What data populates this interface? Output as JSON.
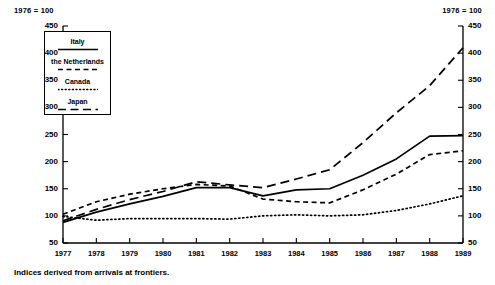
{
  "header": {
    "left_note": "1976 = 100",
    "right_note": "1976 = 100"
  },
  "footnote": "Indices derived from arrivals at frontiers.",
  "legend": {
    "entries": [
      {
        "label": "Italy",
        "style": "solid",
        "color": "#000000"
      },
      {
        "label": "the Netherlands",
        "style": "dashed-short",
        "color": "#000000"
      },
      {
        "label": "Canada",
        "style": "dotted",
        "color": "#000000"
      },
      {
        "label": "Japan",
        "style": "dashed-long",
        "color": "#000000"
      }
    ]
  },
  "chart_data": {
    "type": "line",
    "title": "",
    "subtitle": "",
    "xlabel": "",
    "ylabel": "",
    "note": "1976 = 100",
    "grid": false,
    "legend_position": "upper-left-inside-box",
    "x": [
      1977,
      1978,
      1979,
      1980,
      1981,
      1982,
      1983,
      1984,
      1985,
      1986,
      1987,
      1988,
      1989
    ],
    "xtick_labels": [
      "1977",
      "1978",
      "1979",
      "1980",
      "1981",
      "1982",
      "1983",
      "1984",
      "1985",
      "1986",
      "1987",
      "1988",
      "1989"
    ],
    "xlim": [
      1977,
      1989
    ],
    "ylim": [
      50,
      450
    ],
    "ytick_labels": [
      "50",
      "100",
      "150",
      "200",
      "250",
      "300",
      "350",
      "400",
      "450"
    ],
    "yticks": [
      50,
      100,
      150,
      200,
      250,
      300,
      350,
      400,
      450
    ],
    "y_axis_both_sides": true,
    "series": [
      {
        "name": "Italy",
        "style": "solid",
        "color": "#000000",
        "values": [
          88,
          107,
          122,
          136,
          152,
          152,
          137,
          148,
          150,
          175,
          205,
          247,
          248
        ]
      },
      {
        "name": "the Netherlands",
        "style": "dashed-short",
        "color": "#000000",
        "values": [
          103,
          126,
          140,
          150,
          158,
          155,
          131,
          126,
          124,
          148,
          177,
          213,
          220
        ]
      },
      {
        "name": "Canada",
        "style": "dotted",
        "color": "#000000",
        "values": [
          99,
          92,
          95,
          95,
          95,
          94,
          100,
          102,
          100,
          102,
          110,
          122,
          137
        ]
      },
      {
        "name": "Japan",
        "style": "dashed-long",
        "color": "#000000",
        "values": [
          91,
          112,
          130,
          145,
          163,
          157,
          152,
          168,
          185,
          235,
          290,
          340,
          410
        ]
      }
    ]
  }
}
